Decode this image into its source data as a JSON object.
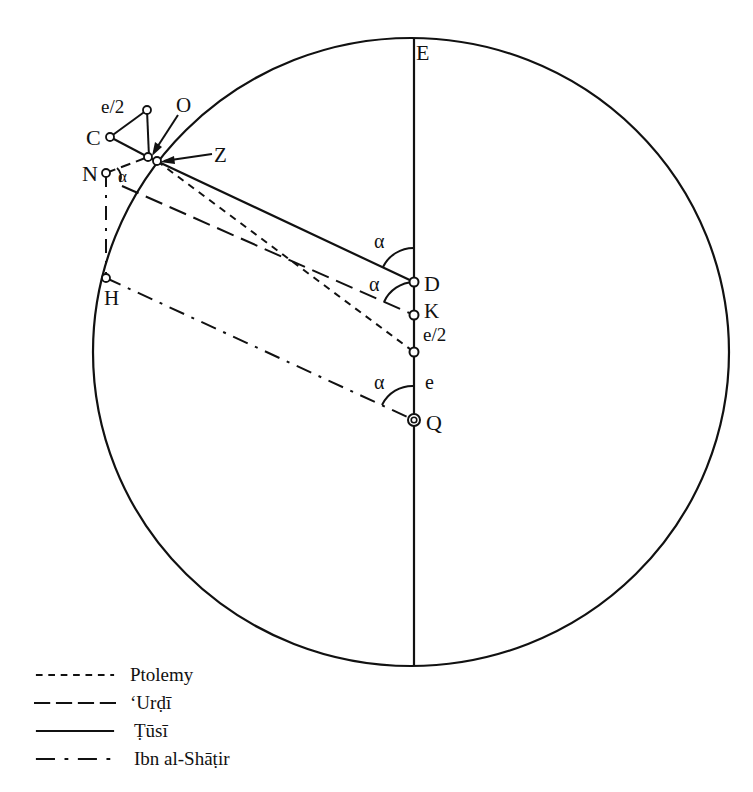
{
  "figure": {
    "type": "geometric-diagram"
  },
  "points": {
    "E": {
      "label": "E",
      "x": 414,
      "y": 38
    },
    "O": {
      "label": "O",
      "x": 152,
      "y": 158
    },
    "Z": {
      "label": "Z",
      "x": 157,
      "y": 161
    },
    "C": {
      "label": "C",
      "x": 110,
      "y": 137
    },
    "N": {
      "label": "N",
      "x": 106,
      "y": 173
    },
    "H": {
      "label": "H",
      "x": 106,
      "y": 278
    },
    "D": {
      "label": "D",
      "x": 414,
      "y": 282
    },
    "K": {
      "label": "K",
      "x": 414,
      "y": 315
    },
    "Q": {
      "label": "Q",
      "x": 414,
      "y": 420
    }
  },
  "segment_labels": {
    "triangle_side": "e/2",
    "k_to_mid": "e/2",
    "mid_to_q": "e"
  },
  "angle_labels": {
    "at_D": "α",
    "at_K": "α",
    "at_Q": "α",
    "at_N": "α"
  },
  "legend": [
    {
      "style": "short-dash",
      "label": "Ptolemy"
    },
    {
      "style": "long-dash",
      "label": "ʻUrḍī"
    },
    {
      "style": "solid",
      "label": "Ṭūsī"
    },
    {
      "style": "dash-dot",
      "label": "Ibn al-Shāṭir"
    }
  ]
}
